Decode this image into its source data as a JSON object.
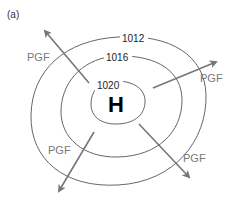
{
  "figure": {
    "panel_label": "(a)",
    "center_label": "H",
    "isobars": [
      {
        "label": "1012"
      },
      {
        "label": "1016"
      },
      {
        "label": "1020"
      }
    ],
    "force_labels": [
      {
        "position": "northwest",
        "label": "PGF"
      },
      {
        "position": "northeast",
        "label": "PGF"
      },
      {
        "position": "southwest",
        "label": "PGF"
      },
      {
        "position": "southeast",
        "label": "PGF"
      }
    ],
    "colors": {
      "isobar": "#555555",
      "arrow": "#777777",
      "text": "#222222",
      "center": "#000000"
    }
  }
}
